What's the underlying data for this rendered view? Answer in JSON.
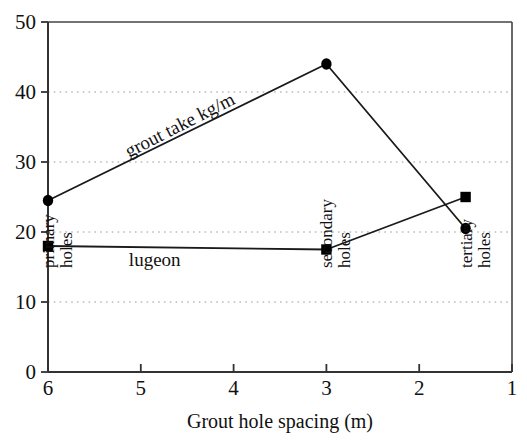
{
  "chart_data": {
    "type": "line",
    "title": "",
    "xlabel": "Grout hole spacing (m)",
    "ylabel": "",
    "xlim": [
      6,
      1
    ],
    "ylim": [
      0,
      50
    ],
    "x_reversed": true,
    "grid": "horizontal dotted gridlines at 10, 20, 30, 40",
    "legend": "inline labels on curves",
    "xticks": [
      "6",
      "5",
      "4",
      "3",
      "2",
      "1"
    ],
    "xtick_values": [
      6,
      5,
      4,
      3,
      2,
      1
    ],
    "yticks": [
      "0",
      "10",
      "20",
      "30",
      "40",
      "50"
    ],
    "ytick_values": [
      0,
      10,
      20,
      30,
      40,
      50
    ],
    "gridline_values": [
      10,
      20,
      30,
      40
    ],
    "x": [
      6,
      3,
      1.5
    ],
    "series": [
      {
        "name": "grout take kg/m",
        "marker": "circle",
        "values": [
          24.5,
          44,
          20.5
        ]
      },
      {
        "name": "lugeon",
        "marker": "square",
        "values": [
          18,
          17.5,
          25
        ]
      }
    ],
    "annotations": [
      {
        "text": "grout take kg/m",
        "x": 4.55,
        "y": 34.5,
        "rotation": -27
      },
      {
        "text": "lugeon",
        "x": 4.85,
        "y": 15.2,
        "rotation": 0
      }
    ],
    "category_labels": [
      {
        "text_line1": "primary",
        "text_line2": "holes",
        "x": 6
      },
      {
        "text_line1": "secondary",
        "text_line2": "holes",
        "x": 3
      },
      {
        "text_line1": "tertiary",
        "text_line2": "holes",
        "x": 1.5
      }
    ],
    "colors": {
      "line": "#1a1a1a",
      "marker": "#000000",
      "grid": "#9a9a9a",
      "axis": "#333333",
      "background": "#ffffff"
    }
  }
}
